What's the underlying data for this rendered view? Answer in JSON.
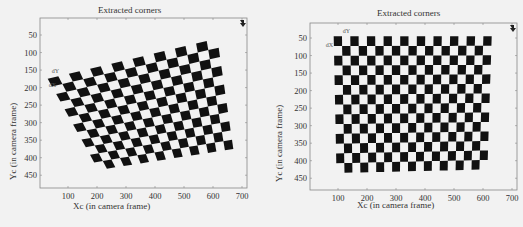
{
  "chart_data": [
    {
      "type": "scatter",
      "title": "Extracted corners",
      "xlabel": "Xc (in camera frame)",
      "ylabel": "Yc (in camera frame)",
      "xticks": [
        100,
        200,
        300,
        400,
        500,
        600,
        700
      ],
      "yticks": [
        50,
        100,
        150,
        200,
        250,
        300,
        350,
        400,
        450
      ],
      "xlim": [
        0,
        720
      ],
      "ylim": [
        0,
        480
      ],
      "y_reversed": true,
      "grid": false,
      "annotations": [
        "dX",
        "dY"
      ],
      "pattern": "checkerboard",
      "board_cols": 16,
      "board_rows": 12,
      "corners": {
        "top_left": [
          30,
          175
        ],
        "top_right": [
          615,
          60
        ],
        "bottom_right": [
          670,
          375
        ],
        "bottom_left": [
          205,
          435
        ]
      }
    },
    {
      "type": "scatter",
      "title": "Extracted corners",
      "xlabel": "Xc (in camera frame)",
      "ylabel": "Yc (in camera frame)",
      "xticks": [
        100,
        200,
        300,
        400,
        500,
        600,
        700
      ],
      "yticks": [
        50,
        100,
        150,
        200,
        250,
        300,
        350,
        400,
        450
      ],
      "xlim": [
        0,
        720
      ],
      "ylim": [
        0,
        480
      ],
      "y_reversed": true,
      "grid": false,
      "annotations": [
        "dX",
        "dY"
      ],
      "pattern": "checkerboard",
      "board_cols": 19,
      "board_rows": 14,
      "corners": {
        "top_left": [
          85,
          45
        ],
        "top_right": [
          630,
          45
        ],
        "bottom_right": [
          615,
          425
        ],
        "bottom_left": [
          95,
          435
        ]
      }
    }
  ],
  "panels": [
    {
      "title": "Extracted corners",
      "xlabel": "Xc (in camera frame)",
      "ylabel": "Yc (in camera frame)",
      "dx": "dX",
      "dy": "dY"
    },
    {
      "title": "Extracted corners",
      "xlabel": "Xc (in camera frame)",
      "ylabel": "Yc (in camera frame)",
      "dx": "dX",
      "dy": "dY"
    }
  ],
  "colors": {
    "square": "#111111",
    "background": "#f2f2f2",
    "axis": "#888888",
    "text": "#333333"
  }
}
